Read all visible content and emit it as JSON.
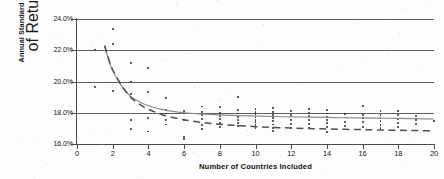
{
  "chart_data": {
    "type": "scatter",
    "title": "",
    "xlabel": "Number of Countries Included",
    "ylabel_line1": "Annual Standard Deviation",
    "ylabel_line2": "of Returns",
    "xlim": [
      0,
      20
    ],
    "ylim": [
      16.0,
      24.0
    ],
    "xticks": [
      0,
      2,
      4,
      6,
      8,
      10,
      12,
      14,
      16,
      18,
      20
    ],
    "xticklabels": [
      "0",
      "2",
      "4",
      "6",
      "8",
      "10",
      "12",
      "14",
      "16",
      "18",
      "20"
    ],
    "yticks": [
      16.0,
      18.0,
      20.0,
      22.0,
      24.0
    ],
    "yticklabels": [
      "16.0%",
      "18.0%",
      "20.0%",
      "22.0%",
      "24.0%"
    ],
    "grid": "horizontal",
    "legend": "none",
    "point_color": "#2b2b2b",
    "points": [
      [
        1,
        19.65
      ],
      [
        1,
        22.05
      ],
      [
        2,
        23.35
      ],
      [
        2,
        22.4
      ],
      [
        2,
        19.4
      ],
      [
        3,
        21.2
      ],
      [
        3,
        20.0
      ],
      [
        3,
        19.2
      ],
      [
        3,
        17.55
      ],
      [
        3,
        16.95
      ],
      [
        4,
        20.85
      ],
      [
        4,
        19.35
      ],
      [
        4,
        17.65
      ],
      [
        4,
        16.8
      ],
      [
        5,
        18.95
      ],
      [
        5,
        18.2
      ],
      [
        5,
        17.95
      ],
      [
        5,
        17.55
      ],
      [
        5,
        17.25
      ],
      [
        6,
        18.1
      ],
      [
        6,
        17.95
      ],
      [
        6,
        17.55
      ],
      [
        6,
        16.45
      ],
      [
        6,
        16.3
      ],
      [
        7,
        18.4
      ],
      [
        7,
        18.05
      ],
      [
        7,
        17.85
      ],
      [
        7,
        17.6
      ],
      [
        7,
        17.2
      ],
      [
        7,
        16.95
      ],
      [
        8,
        18.35
      ],
      [
        8,
        18.0
      ],
      [
        8,
        17.8
      ],
      [
        8,
        17.6
      ],
      [
        8,
        17.35
      ],
      [
        8,
        17.1
      ],
      [
        9,
        19.0
      ],
      [
        9,
        18.15
      ],
      [
        9,
        17.95
      ],
      [
        9,
        17.75
      ],
      [
        9,
        17.55
      ],
      [
        9,
        17.35
      ],
      [
        9,
        17.15
      ],
      [
        10,
        18.25
      ],
      [
        10,
        18.05
      ],
      [
        10,
        17.9
      ],
      [
        10,
        17.75
      ],
      [
        10,
        17.55
      ],
      [
        10,
        17.4
      ],
      [
        10,
        17.2
      ],
      [
        10,
        17.05
      ],
      [
        11,
        18.3
      ],
      [
        11,
        18.05
      ],
      [
        11,
        17.85
      ],
      [
        11,
        17.65
      ],
      [
        11,
        17.45
      ],
      [
        11,
        17.25
      ],
      [
        11,
        17.05
      ],
      [
        11,
        16.85
      ],
      [
        12,
        18.1
      ],
      [
        12,
        17.85
      ],
      [
        12,
        17.55
      ],
      [
        12,
        17.3
      ],
      [
        12,
        17.05
      ],
      [
        13,
        18.25
      ],
      [
        13,
        18.0
      ],
      [
        13,
        17.8
      ],
      [
        13,
        17.55
      ],
      [
        13,
        17.3
      ],
      [
        13,
        17.05
      ],
      [
        14,
        18.15
      ],
      [
        14,
        17.95
      ],
      [
        14,
        17.75
      ],
      [
        14,
        17.55
      ],
      [
        14,
        17.35
      ],
      [
        14,
        17.1
      ],
      [
        14,
        16.75
      ],
      [
        15,
        17.9
      ],
      [
        15,
        17.7
      ],
      [
        15,
        17.4
      ],
      [
        15,
        17.15
      ],
      [
        16,
        18.45
      ],
      [
        16,
        17.85
      ],
      [
        16,
        17.65
      ],
      [
        16,
        17.4
      ],
      [
        16,
        17.1
      ],
      [
        17,
        18.1
      ],
      [
        17,
        17.85
      ],
      [
        17,
        17.65
      ],
      [
        17,
        17.45
      ],
      [
        17,
        17.2
      ],
      [
        17,
        17.0
      ],
      [
        18,
        18.1
      ],
      [
        18,
        17.85
      ],
      [
        18,
        17.6
      ],
      [
        18,
        17.35
      ],
      [
        18,
        17.1
      ],
      [
        19,
        17.8
      ],
      [
        19,
        17.55
      ],
      [
        19,
        17.3
      ],
      [
        20,
        17.45
      ]
    ],
    "series": [
      {
        "name": "solid-fit-curve",
        "style": "solid",
        "color": "#8a8a8a",
        "asymptote": 17.55,
        "x": [
          1.55,
          1.8,
          2,
          2.5,
          3,
          3.5,
          4,
          5,
          6,
          7,
          8,
          9,
          10,
          11,
          12,
          13,
          14,
          15,
          16,
          17,
          18,
          19,
          20
        ],
        "y": [
          22.25,
          21.3,
          20.7,
          19.7,
          19.05,
          18.7,
          18.45,
          18.15,
          18.0,
          17.92,
          17.86,
          17.82,
          17.79,
          17.76,
          17.74,
          17.72,
          17.7,
          17.68,
          17.67,
          17.65,
          17.64,
          17.62,
          17.6
        ]
      },
      {
        "name": "dashed-fit-curve",
        "style": "dashed",
        "color": "#4f4f4f",
        "asymptote": 16.85,
        "x": [
          1.55,
          1.8,
          2,
          2.5,
          3,
          3.5,
          4,
          5,
          6,
          7,
          8,
          9,
          10,
          11,
          12,
          13,
          14,
          15,
          16,
          17,
          18,
          19,
          20
        ],
        "y": [
          22.3,
          21.35,
          20.75,
          19.75,
          19.0,
          18.55,
          18.22,
          17.8,
          17.55,
          17.38,
          17.26,
          17.18,
          17.11,
          17.06,
          17.02,
          16.99,
          16.96,
          16.94,
          16.92,
          16.9,
          16.88,
          16.86,
          16.84
        ]
      }
    ]
  }
}
